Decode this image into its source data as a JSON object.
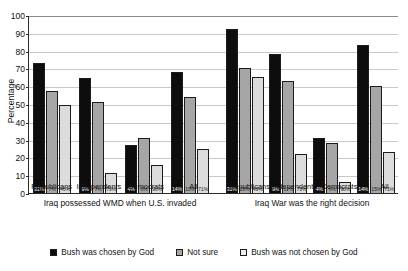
{
  "chart_data": {
    "type": "bar",
    "title": "",
    "xlabel": "",
    "ylabel": "Percentage",
    "ylim": [
      0,
      100
    ],
    "yticks": [
      0,
      10,
      20,
      30,
      40,
      50,
      60,
      70,
      80,
      90,
      100
    ],
    "grid": true,
    "legend_position": "bottom",
    "legend": [
      "Bush was chosen by God",
      "Not sure",
      "Bush was not chosen by God"
    ],
    "colors": {
      "series0": "#0d0d0d",
      "series1": "#a6a6a6",
      "series2": "#dcdcdc",
      "gridline": "#c9c9c9",
      "axis": "#2b2b2b",
      "background": "#ffffff"
    },
    "categories": [
      "Republicans",
      "Independents",
      "Democrats",
      "All"
    ],
    "panels": [
      {
        "caption": "Iraq possessed WMD when U.S. invaded",
        "series": [
          {
            "name": "Bush was chosen by God",
            "values": [
              73,
              64.5,
              27,
              68
            ],
            "labels": [
              "31%",
              "9%",
              "4%",
              "14%"
            ]
          },
          {
            "name": "Not sure",
            "values": [
              57.5,
              51,
              31,
              54
            ],
            "labels": [
              "7%",
              "7%",
              "6%",
              "10%"
            ]
          },
          {
            "name": "Bush was not chosen by God",
            "values": [
              49.5,
              11.5,
              16,
              25
            ],
            "labels": [
              "46%",
              "73%",
              "90%",
              "71%"
            ]
          }
        ]
      },
      {
        "caption": "Iraq War was the right decision",
        "series": [
          {
            "name": "Bush was chosen by God",
            "values": [
              92,
              78,
              31,
              83
            ],
            "labels": [
              "31%",
              "9%",
              "4%",
              "14%"
            ]
          },
          {
            "name": "Not sure",
            "values": [
              70,
              63,
              28,
              60
            ],
            "labels": [
              "28%",
              "17%",
              "6%",
              "15%"
            ]
          },
          {
            "name": "Bush was not chosen by God",
            "values": [
              65,
              22,
              6,
              23
            ],
            "labels": [
              "49%",
              "73%",
              "90%",
              "71%"
            ]
          }
        ]
      }
    ]
  }
}
